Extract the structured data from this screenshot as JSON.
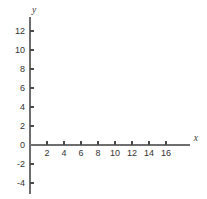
{
  "chart_data": {
    "type": "scatter",
    "title": "",
    "subtitle": "",
    "xlabel": "x",
    "ylabel": "y",
    "xlim": [
      0,
      18.8
    ],
    "ylim": [
      -5.2,
      13.5
    ],
    "x_ticks": [
      2,
      4,
      6,
      8,
      10,
      12,
      14,
      16
    ],
    "x_tick_labels": [
      "2",
      "4",
      "6",
      "8",
      "10",
      "12",
      "14",
      "16"
    ],
    "y_ticks": [
      -4,
      -2,
      0,
      2,
      4,
      6,
      8,
      10,
      12
    ],
    "y_tick_labels": [
      "-4",
      "-2",
      "0",
      "2",
      "4",
      "6",
      "8",
      "10",
      "12"
    ],
    "grid": false,
    "legend": null,
    "series": [],
    "values": [],
    "annotations": [],
    "note": "empty coordinate axes, no data plotted"
  },
  "colors": {
    "background": "#ffffff",
    "axis": "#6e6e6e",
    "tick": "#4a4a4a",
    "text": "#333333",
    "axis_label": "#3a3a3a"
  }
}
